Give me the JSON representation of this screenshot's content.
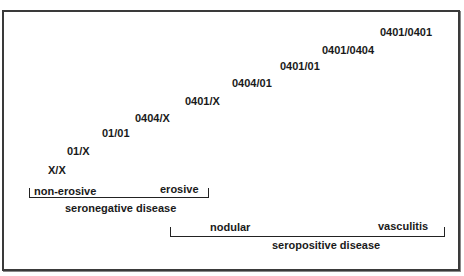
{
  "genotypes": [
    {
      "label": "X/X",
      "x": 48,
      "y": 164
    },
    {
      "label": "01/X",
      "x": 67,
      "y": 145
    },
    {
      "label": "01/01",
      "x": 102,
      "y": 127
    },
    {
      "label": "0404/X",
      "x": 135,
      "y": 112
    },
    {
      "label": "0401/X",
      "x": 185,
      "y": 95
    },
    {
      "label": "0404/01",
      "x": 232,
      "y": 77
    },
    {
      "label": "0401/01",
      "x": 280,
      "y": 60
    },
    {
      "label": "0401/0404",
      "x": 322,
      "y": 44
    },
    {
      "label": "0401/0401",
      "x": 380,
      "y": 26
    }
  ],
  "seronegative": {
    "left_label": "non-erosive",
    "right_label": "erosive",
    "group_label": "seronegative disease"
  },
  "seropositive": {
    "left_label": "nodular",
    "right_label": "vasculitis",
    "group_label": "seropositive disease"
  }
}
